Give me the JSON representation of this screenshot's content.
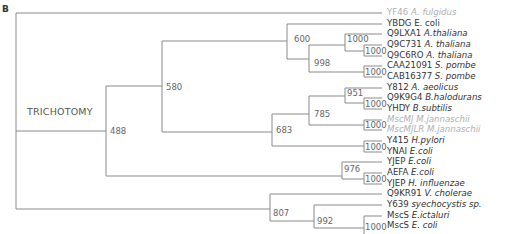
{
  "panel_label": "B",
  "root_annotation": "TRICHOTOMY",
  "line_color": "#8a8a8a",
  "leaves": [
    {
      "id": "YF46",
      "species": "A. fulgidus",
      "grey": true
    },
    {
      "id": "YBDG",
      "species": "E. coli",
      "grey": false
    },
    {
      "id": "Q9LXA1",
      "species": "A.thaliana",
      "grey": false
    },
    {
      "id": "Q9C731",
      "species": "A. thaliana",
      "grey": false
    },
    {
      "id": "Q9C6RO",
      "species": "A. thaliana",
      "grey": false
    },
    {
      "id": "CAA21091",
      "species": "S. pombe",
      "grey": false
    },
    {
      "id": "CAB16377",
      "species": "S. pombe",
      "grey": false
    },
    {
      "id": "Y812",
      "species": "A. aeolicus",
      "grey": false
    },
    {
      "id": "Q9K9G4",
      "species": "B.halodurans",
      "grey": false
    },
    {
      "id": "YHDY",
      "species": "B.subtilis",
      "grey": false
    },
    {
      "id": "MscMJ",
      "species": "M.jannaschii",
      "grey": true
    },
    {
      "id": "MscMJLR",
      "species": "M.jannaschii",
      "grey": true
    },
    {
      "id": "Y415",
      "species": "H.pylori",
      "grey": false
    },
    {
      "id": "YNAI",
      "species": "E.coli",
      "grey": false
    },
    {
      "id": "YJEP",
      "species": "E.coli",
      "grey": false
    },
    {
      "id": "AEFA",
      "species": "E.coli",
      "grey": false
    },
    {
      "id": "YJEP",
      "species": "H. influenzae",
      "grey": false
    },
    {
      "id": "Q9KR91",
      "species": "V. cholerae",
      "grey": false
    },
    {
      "id": "Y639",
      "species": "syechocystis sp.",
      "grey": false
    },
    {
      "id": "MscS",
      "species": "E.ictaluri",
      "grey": false
    },
    {
      "id": "MscS",
      "species": "E. coli",
      "grey": false
    }
  ],
  "bootstrap": {
    "n488": "488",
    "n580": "580",
    "n600": "600",
    "n998": "998",
    "n1000_thaliana_outer": "1000",
    "n1000_thaliana_inner": "1000",
    "n1000_pombe": "1000",
    "n683": "683",
    "n785": "785",
    "n951": "951",
    "n1000_bacillus": "1000",
    "n1000_mjannaschii": "1000",
    "n1000_pylori_ecoli": "1000",
    "n976": "976",
    "n1000_yjep": "1000",
    "n807": "807",
    "n992": "992",
    "n1000_mscs": "1000"
  }
}
